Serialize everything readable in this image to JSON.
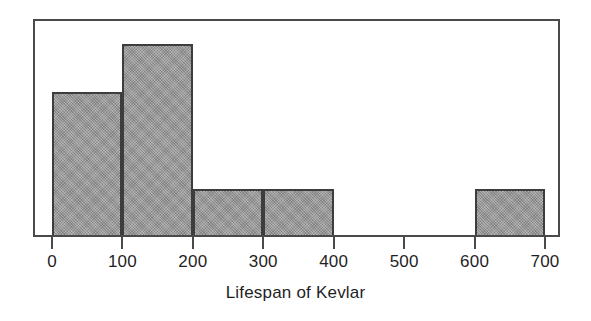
{
  "chart_data": {
    "type": "bar",
    "title": "",
    "subtitle": "",
    "xlabel": "Lifespan of Kevlar",
    "ylabel": "",
    "grid": false,
    "legend": null,
    "xlim": [
      0,
      700
    ],
    "ylim": [
      0,
      9
    ],
    "bin_width": 100,
    "xticks": [
      0,
      100,
      200,
      300,
      400,
      500,
      600,
      700
    ],
    "xtick_labels": [
      "0",
      "100",
      "200",
      "300",
      "400",
      "500",
      "600",
      "700"
    ],
    "yticks": [],
    "ytick_labels": [],
    "categories": [
      "0-100",
      "100-200",
      "200-300",
      "300-400",
      "400-500",
      "500-600",
      "600-700"
    ],
    "bin_edges": [
      0,
      100,
      200,
      300,
      400,
      500,
      600,
      700
    ],
    "values": [
      6,
      8,
      2,
      2,
      0,
      0,
      2
    ],
    "series": [
      {
        "name": "Lifespan of Kevlar",
        "values": [
          6,
          8,
          2,
          2,
          0,
          0,
          2
        ]
      }
    ],
    "annotations": [],
    "colors": {
      "bar_fill": "#9b9b9b",
      "bar_border": "#3d3d3d",
      "frame": "#4a4a4a",
      "text": "#1f1f1f",
      "background": "#ffffff"
    }
  },
  "axis": {
    "x_title": "Lifespan of Kevlar",
    "ticks": [
      {
        "value": 0,
        "label": "0"
      },
      {
        "value": 100,
        "label": "100"
      },
      {
        "value": 200,
        "label": "200"
      },
      {
        "value": 300,
        "label": "300"
      },
      {
        "value": 400,
        "label": "400"
      },
      {
        "value": 500,
        "label": "500"
      },
      {
        "value": 600,
        "label": "600"
      },
      {
        "value": 700,
        "label": "700"
      }
    ]
  },
  "bars": [
    {
      "label": "0-100",
      "start": 0,
      "end": 100,
      "value": 6
    },
    {
      "label": "100-200",
      "start": 100,
      "end": 200,
      "value": 8
    },
    {
      "label": "200-300",
      "start": 200,
      "end": 300,
      "value": 2
    },
    {
      "label": "300-400",
      "start": 300,
      "end": 400,
      "value": 2
    },
    {
      "label": "400-500",
      "start": 400,
      "end": 500,
      "value": 0
    },
    {
      "label": "500-600",
      "start": 500,
      "end": 600,
      "value": 0
    },
    {
      "label": "600-700",
      "start": 600,
      "end": 700,
      "value": 2
    }
  ]
}
